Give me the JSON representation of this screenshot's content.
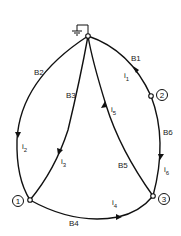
{
  "diagram": {
    "type": "circuit-graph",
    "ground": {
      "label": "ground",
      "node": "0"
    },
    "nodes": [
      {
        "id": "0",
        "label": "",
        "x": 88,
        "y": 36
      },
      {
        "id": "1",
        "label": "1",
        "x": 30,
        "y": 200
      },
      {
        "id": "2",
        "label": "2",
        "x": 151,
        "y": 96
      },
      {
        "id": "3",
        "label": "3",
        "x": 153,
        "y": 196
      }
    ],
    "branches": [
      {
        "name": "B1",
        "from": "0",
        "to": "2",
        "current": "i",
        "current_sub": "1"
      },
      {
        "name": "B2",
        "from": "0",
        "to": "1",
        "current": "i",
        "current_sub": "2"
      },
      {
        "name": "B3",
        "from": "0",
        "to": "1",
        "current": "i",
        "current_sub": "3"
      },
      {
        "name": "B4",
        "from": "1",
        "to": "3",
        "current": "i",
        "current_sub": "4"
      },
      {
        "name": "B5",
        "from": "3",
        "to": "0",
        "current": "i",
        "current_sub": "5"
      },
      {
        "name": "B6",
        "from": "2",
        "to": "3",
        "current": "i",
        "current_sub": "6"
      }
    ],
    "colors": {
      "line": "#111111",
      "background": "#ffffff"
    }
  }
}
